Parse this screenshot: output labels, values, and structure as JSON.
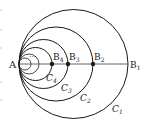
{
  "diagram": {
    "point_A": {
      "label": "A",
      "x": 19,
      "y": 64
    },
    "line": {
      "from": "A",
      "to": "B1",
      "x1": 19,
      "x2": 128,
      "y": 64
    },
    "ellipsis": "···",
    "points": [
      {
        "id": "B1",
        "base": "B",
        "sub": "1",
        "x": 128,
        "y": 64,
        "dot": false
      },
      {
        "id": "B2",
        "base": "B",
        "sub": "2",
        "x": 93,
        "y": 64,
        "dot": true
      },
      {
        "id": "B3",
        "base": "B",
        "sub": "3",
        "x": 68,
        "y": 64,
        "dot": true
      },
      {
        "id": "B4",
        "base": "B",
        "sub": "4",
        "x": 52,
        "y": 64,
        "dot": true
      }
    ],
    "circles": [
      {
        "id": "C1",
        "base": "C",
        "sub": "1",
        "cx": 73.5,
        "cy": 64,
        "r": 54.5
      },
      {
        "id": "C2",
        "base": "C",
        "sub": "2",
        "cx": 56,
        "cy": 64,
        "r": 37
      },
      {
        "id": "C3",
        "base": "C",
        "sub": "3",
        "cx": 43.5,
        "cy": 64,
        "r": 24.5
      },
      {
        "id": "C4",
        "base": "C",
        "sub": "4",
        "cx": 35.5,
        "cy": 64,
        "r": 16.5
      }
    ],
    "colors": {
      "stroke": "#1a1a1a",
      "axis": "#555555",
      "background": "#ffffff"
    }
  }
}
